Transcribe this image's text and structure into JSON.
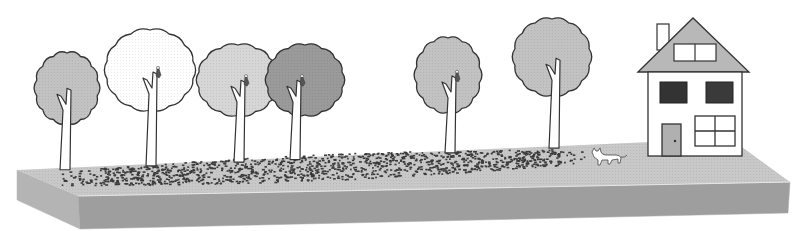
{
  "scene": {
    "description": "Street with a row of six trees, leaves scattered on the ground, a cat walking, and a two-storey house at the right end",
    "colors": {
      "background": "#ffffff",
      "slab_top": "#c8c8c8",
      "slab_front": "#9e9e9e",
      "slab_side": "#b4b4b4",
      "outline": "#333333",
      "tree_light": "#d6d6d6",
      "tree_medium": "#c2c2c2",
      "tree_dark": "#9a9a9a",
      "tree_white": "#ffffff",
      "leaf": "#3a3a3a",
      "house_wall": "#ffffff",
      "roof": "#b8b8b8",
      "window_dark": "#333333",
      "door": "#b0b0b0"
    },
    "trees": [
      {
        "id": "tree-1",
        "cx": 67,
        "cy": 88,
        "rx": 31,
        "ry": 35,
        "fill": "medium",
        "trunk_x": 66,
        "bird": false
      },
      {
        "id": "tree-2",
        "cx": 150,
        "cy": 70,
        "rx": 44,
        "ry": 40,
        "fill": "white",
        "trunk_x": 152,
        "bird": true
      },
      {
        "id": "tree-3",
        "cx": 238,
        "cy": 80,
        "rx": 40,
        "ry": 35,
        "fill": "light",
        "trunk_x": 240,
        "bird": true
      },
      {
        "id": "tree-4",
        "cx": 305,
        "cy": 80,
        "rx": 38,
        "ry": 35,
        "fill": "dark",
        "trunk_x": 296,
        "bird": true
      },
      {
        "id": "tree-5",
        "cx": 448,
        "cy": 75,
        "rx": 32,
        "ry": 37,
        "fill": "medium",
        "trunk_x": 451,
        "bird": true
      },
      {
        "id": "tree-6",
        "cx": 552,
        "cy": 57,
        "rx": 38,
        "ry": 38,
        "fill": "medium",
        "trunk_x": 555,
        "bird": false
      }
    ],
    "house": {
      "chimney": true,
      "attic_window_panes": 2,
      "upper_windows": 2,
      "lower_window_panes": 4,
      "door": true
    },
    "animal": "cat",
    "ground_cover": "fallen leaves"
  }
}
